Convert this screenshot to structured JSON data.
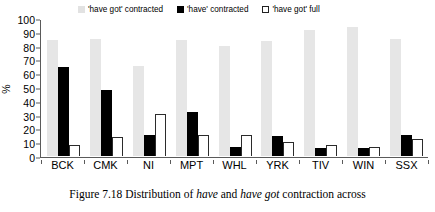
{
  "chart_data": {
    "type": "bar",
    "title": "",
    "xlabel": "",
    "ylabel": "%",
    "ylim": [
      0,
      100
    ],
    "yticks": [
      100,
      90,
      80,
      70,
      60,
      50,
      40,
      30,
      20,
      10,
      0
    ],
    "grid": false,
    "legend_position": "top",
    "categories": [
      "BCK",
      "CMK",
      "NI",
      "MPT",
      "WHL",
      "YRK",
      "TIV",
      "WIN",
      "SSX"
    ],
    "series": [
      {
        "name": "'have got' contracted",
        "color": "#e6e6e6",
        "values": [
          84,
          85,
          65,
          84,
          80,
          83,
          91.5,
          93.5,
          85
        ]
      },
      {
        "name": "'have' contracted",
        "color": "#000000",
        "values": [
          64.5,
          48,
          15,
          32,
          6.5,
          14.5,
          5.5,
          6,
          15
        ]
      },
      {
        "name": "'have got' full",
        "color": "#ffffff",
        "values": [
          8,
          14,
          30.5,
          15.5,
          15.5,
          10.5,
          8,
          6.5,
          12.5
        ]
      }
    ]
  },
  "caption": {
    "prefix": "Figure 7.18 Distribution of ",
    "italic1": "have",
    "middle": " and ",
    "italic2": "have got",
    "suffix": " contraction across"
  }
}
